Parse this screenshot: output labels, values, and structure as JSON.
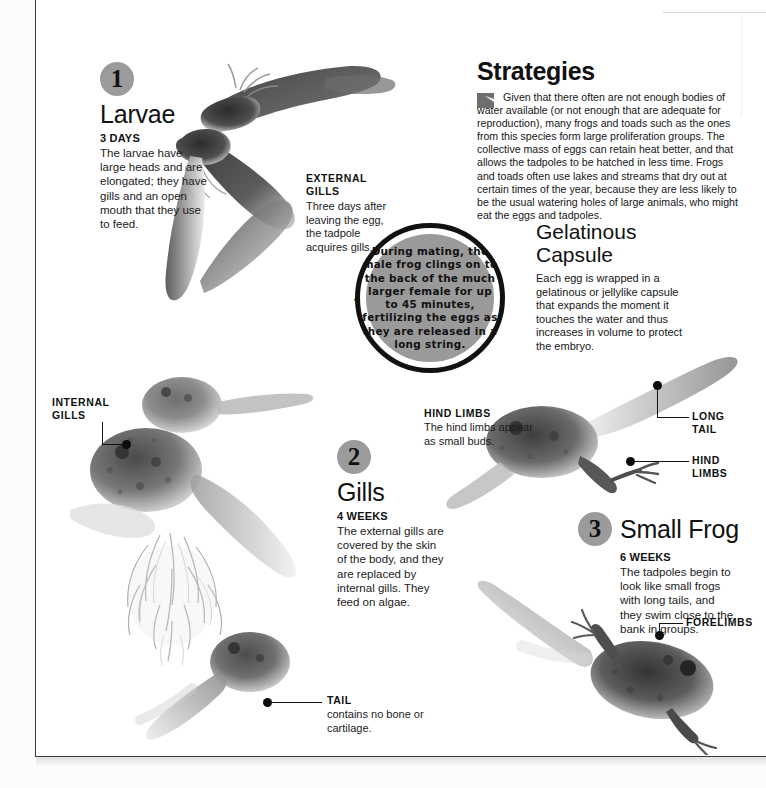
{
  "steps": [
    {
      "number": "1",
      "title": "Larvae",
      "subtitle": "3 DAYS",
      "body": "The larvae have large heads and are elongated; they have gills and an open mouth that they use to feed."
    },
    {
      "number": "2",
      "title": "Gills",
      "subtitle": "4 WEEKS",
      "body": "The external gills are covered by the skin of the body, and they are replaced by internal gills. They feed on algae."
    },
    {
      "number": "3",
      "title": "Small Frog",
      "subtitle": "6 WEEKS",
      "body": "The tadpoles begin to look like small frogs with long tails, and they swim close to the bank in groups."
    }
  ],
  "sections": {
    "strategies": {
      "title": "Strategies",
      "body": "Given that there often are not enough bodies of water available (or not enough that are adequate for reproduction), many frogs and toads such as the ones from this species form large proliferation groups. The collective mass of eggs can retain heat better, and that allows the tadpoles to be hatched in less time. Frogs and toads often use lakes and streams that dry out at certain times of the year, because they are less likely to be the usual watering holes of large animals, who might eat the eggs and tadpoles."
    },
    "gelatinous_capsule": {
      "title_line1": "Gelatinous",
      "title_line2": "Capsule",
      "body": "Each egg is wrapped in a gelatinous or jellylike capsule that expands the moment it touches the water and thus increases in volume to protect the embryo."
    }
  },
  "amazing_fact": {
    "arc_label": "AMAZING FACT",
    "text": "During mating, the male frog clings on to the back of the much larger female for up to 45 minutes, fertilizing the eggs as they are released in a long string."
  },
  "callouts": {
    "external_gills": {
      "title_line1": "EXTERNAL",
      "title_line2": "GILLS",
      "body": "Three days after leaving the egg, the tadpole acquires gills."
    },
    "internal_gills": {
      "title_line1": "INTERNAL",
      "title_line2": "GILLS"
    },
    "hind_limbs_center": {
      "title": "HIND LIMBS",
      "body": "The hind limbs appear as small buds."
    },
    "long_tail": {
      "title_line1": "LONG",
      "title_line2": "TAIL"
    },
    "hind_limbs_right": {
      "title_line1": "HIND",
      "title_line2": "LIMBS"
    },
    "tail": {
      "title": "TAIL",
      "body": "contains no bone or cartilage."
    },
    "forelimbs": {
      "title": "FORELIMBS"
    }
  },
  "colors": {
    "number_circle": "#9b9b9b",
    "ink": "#111111",
    "fact_fill": "#9a9a9a",
    "page": "#ffffff"
  }
}
